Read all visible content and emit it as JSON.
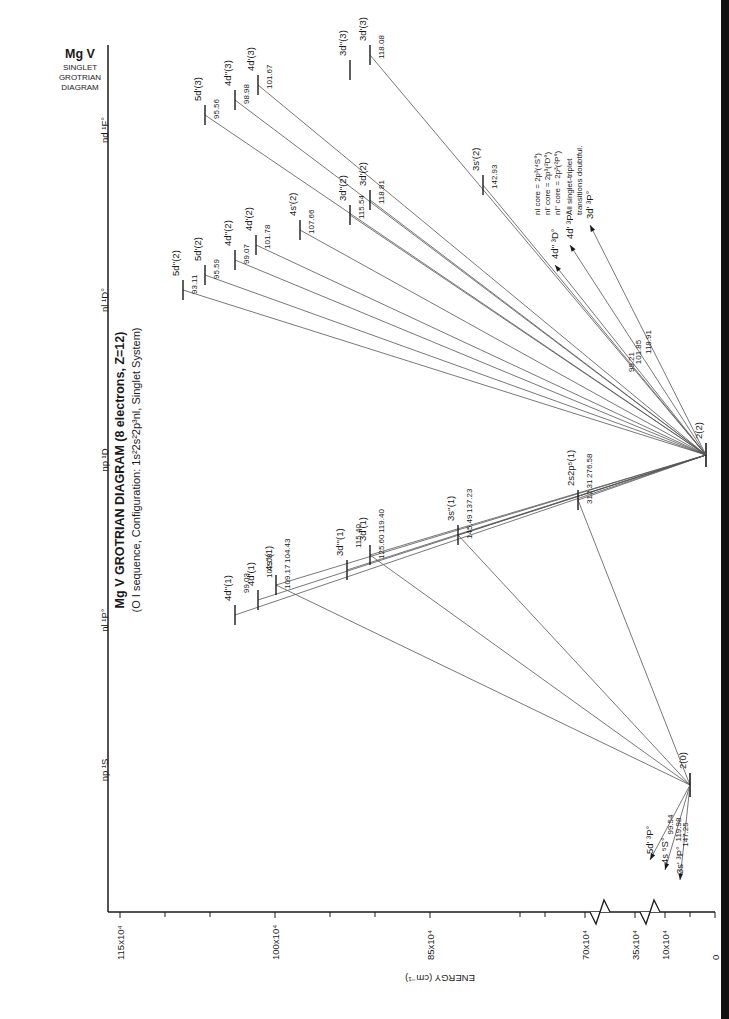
{
  "corner_label": {
    "element": "Mg V",
    "line1": "SINGLET",
    "line2": "GROTRIAN",
    "line3": "DIAGRAM"
  },
  "title": {
    "main": "Mg V  GROTRIAN DIAGRAM (8 electrons, Z=12)",
    "sub": "(O I sequence, Configuration: 1s²2s²2p³nl, Singlet System)"
  },
  "columns": [
    {
      "id": "npS",
      "label": "np ¹S",
      "y": 770
    },
    {
      "id": "nlP",
      "label": "nl ¹P°",
      "y": 620
    },
    {
      "id": "npD",
      "label": "np ¹D",
      "y": 460
    },
    {
      "id": "nlD",
      "label": "nl ¹D°",
      "y": 300
    },
    {
      "id": "ndF",
      "label": "nd ¹F°",
      "y": 130
    }
  ],
  "energy_axis": {
    "label": "ENERGY (cm⁻¹)",
    "ticks": [
      {
        "label": "115x10⁴",
        "x": 120
      },
      {
        "label": "100x10⁴",
        "x": 275
      },
      {
        "label": "85x10⁴",
        "x": 430
      },
      {
        "label": "70x10⁴",
        "x": 585
      },
      {
        "label": "35x10⁴",
        "x": 635
      },
      {
        "label": "10x10⁴",
        "x": 665
      },
      {
        "label": "0",
        "x": 715
      }
    ],
    "breaks": [
      600,
      650
    ]
  },
  "ground_levels": [
    {
      "id": "2_0",
      "label": "2(0)",
      "x": 690,
      "y": 785
    },
    {
      "id": "2_2",
      "label": "2(2)",
      "x": 706,
      "y": 455
    }
  ],
  "levels": [
    {
      "group": "nlP",
      "label": "4d''(1)",
      "x": 235,
      "y": 615,
      "line": "99.03",
      "from": "2_2"
    },
    {
      "group": "nlP",
      "label": "4d'(1)",
      "x": 258,
      "y": 600,
      "line": "102.08",
      "from": "2_2"
    },
    {
      "group": "nlP",
      "label": "4s''(1)",
      "x": 276,
      "y": 585,
      "line": "104.43",
      "from": "2_2"
    },
    {
      "group": "nlP",
      "label": "",
      "x": 276,
      "y": 585,
      "line": "109.17",
      "from": "2_0"
    },
    {
      "group": "nlP",
      "label": "3d'''(1)",
      "x": 347,
      "y": 570,
      "line": "115.40",
      "from": "2_2"
    },
    {
      "group": "nlP",
      "label": "3d'(1)",
      "x": 370,
      "y": 555,
      "line": "119.40",
      "from": "2_2"
    },
    {
      "group": "nlP",
      "label": "",
      "x": 370,
      "y": 555,
      "line": "125.60",
      "from": "2_0"
    },
    {
      "group": "nlP",
      "label": "3s''(1)",
      "x": 458,
      "y": 535,
      "line": "137.23",
      "from": "2_2"
    },
    {
      "group": "nlP",
      "label": "",
      "x": 458,
      "y": 535,
      "line": "145.49",
      "from": "2_0"
    },
    {
      "group": "nlP",
      "label": "2s2p⁵(1)",
      "x": 578,
      "y": 500,
      "line": "276.58",
      "from": "2_2"
    },
    {
      "group": "nlP",
      "label": "",
      "x": 578,
      "y": 500,
      "line": "312.31",
      "from": "2_0"
    },
    {
      "group": "nlD",
      "label": "5d''(2)",
      "x": 183,
      "y": 290,
      "line": "93.11",
      "from": "2_2"
    },
    {
      "group": "nlD",
      "label": "5d'(2)",
      "x": 205,
      "y": 275,
      "line": "95.59",
      "from": "2_2"
    },
    {
      "group": "nlD",
      "label": "4d''(2)",
      "x": 235,
      "y": 260,
      "line": "99.07",
      "from": "2_2"
    },
    {
      "group": "nlD",
      "label": "4d'(2)",
      "x": 256,
      "y": 245,
      "line": "101.78",
      "from": "2_2"
    },
    {
      "group": "nlD",
      "label": "4s'(2)",
      "x": 300,
      "y": 230,
      "line": "107.66",
      "from": "2_2"
    },
    {
      "group": "nlD",
      "label": "3d''(2)",
      "x": 350,
      "y": 215,
      "line": "115.54",
      "from": "2_2"
    },
    {
      "group": "nlD",
      "label": "3d'(2)",
      "x": 370,
      "y": 200,
      "line": "118.81",
      "from": "2_2"
    },
    {
      "group": "nlD",
      "label": "3s'(2)",
      "x": 483,
      "y": 185,
      "line": "142.93",
      "from": "2_2"
    },
    {
      "group": "ndF",
      "label": "5d'(3)",
      "x": 205,
      "y": 115,
      "line": "95.56",
      "from": "2_2"
    },
    {
      "group": "ndF",
      "label": "4d''(3)",
      "x": 235,
      "y": 100,
      "line": "98.98",
      "from": "2_2"
    },
    {
      "group": "ndF",
      "label": "4d'(3)",
      "x": 258,
      "y": 85,
      "line": "101.67",
      "from": "2_2"
    },
    {
      "group": "ndF",
      "label": "3d''(3)",
      "x": 350,
      "y": 70,
      "line": "",
      "from": ""
    },
    {
      "group": "ndF",
      "label": "3d'(3)",
      "x": 370,
      "y": 55,
      "line": "118.08",
      "from": "2_2"
    }
  ],
  "triplet_transitions": [
    {
      "target": "4d'' ³D°",
      "line": "99.21",
      "from": "2_2",
      "arrow_x": 555,
      "arrow_y": 265
    },
    {
      "target": "4d' ³P°",
      "line": "101.85",
      "from": "2_2",
      "arrow_x": 570,
      "arrow_y": 245
    },
    {
      "target": "3d' ³P°",
      "line": "118.91",
      "from": "2_2",
      "arrow_x": 590,
      "arrow_y": 225
    },
    {
      "target": "5d' ³P°",
      "line": "99.54",
      "from": "2_0",
      "arrow_x": 650,
      "arrow_y": 860
    },
    {
      "target": "4s ⁵S°",
      "line": "119.98",
      "from": "2_0",
      "arrow_x": 665,
      "arrow_y": 870
    },
    {
      "target": "3s' ³P°",
      "line": "147.25",
      "from": "2_0",
      "arrow_x": 680,
      "arrow_y": 880
    }
  ],
  "notes": {
    "core1": "nl core = 2p³(⁴S°)",
    "core2": "nl' core = 2p³(²D°)",
    "core3": "nl'' core = 2p³(²P°)",
    "doubt1": "All singlet-triplet",
    "doubt2": "transitions doubtful."
  },
  "colors": {
    "ink": "#1a1a1a",
    "line": "#555555",
    "paper": "#ffffff"
  }
}
